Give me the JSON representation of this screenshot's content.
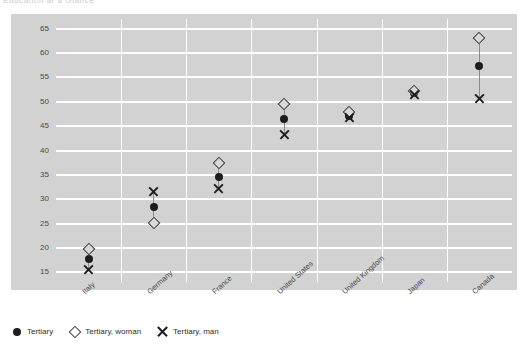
{
  "header": {
    "clipped_text": "Education at a Glance"
  },
  "chart_data": {
    "type": "scatter",
    "title": "",
    "xlabel": "",
    "ylabel": "",
    "ylim": [
      13,
      67
    ],
    "yticks": [
      15,
      20,
      25,
      30,
      35,
      40,
      45,
      50,
      55,
      60,
      65
    ],
    "grid": true,
    "legend_position": "bottom-left",
    "categories": [
      "Italy",
      "Germany",
      "France",
      "United States",
      "United Kingdom",
      "Japan",
      "Canada"
    ],
    "series": [
      {
        "name": "Tertiary",
        "marker": "filled-circle",
        "color": "#1d1d1d",
        "values": [
          17.8,
          28.5,
          34.5,
          46.4,
          47.0,
          51.8,
          57.3
        ]
      },
      {
        "name": "Tertiary, woman",
        "marker": "open-diamond",
        "color": "#3c3c3c",
        "values": [
          19.7,
          25.2,
          37.5,
          49.5,
          48.0,
          52.2,
          63.0
        ]
      },
      {
        "name": "Tertiary, man",
        "marker": "cross-x",
        "color": "#1d1d1d",
        "values": [
          15.5,
          31.5,
          32.2,
          43.2,
          46.8,
          51.6,
          50.7
        ]
      }
    ]
  },
  "legend": {
    "items": [
      {
        "label": "Tertiary",
        "icon": "filled-circle-icon"
      },
      {
        "label": "Tertiary, woman",
        "icon": "open-diamond-icon"
      },
      {
        "label": "Tertiary, man",
        "icon": "cross-x-icon"
      }
    ]
  },
  "colors": {
    "panel_background": "#d2d2d2",
    "gridline": "#ffffff",
    "marker_dark": "#1d1d1d",
    "connector": "#8a8a8a",
    "tick_text": "#4a4a4a"
  }
}
